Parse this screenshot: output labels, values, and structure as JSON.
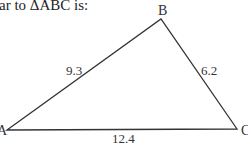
{
  "prompt": {
    "text": "ar to ΔABC is:"
  },
  "triangle": {
    "name": "ΔABC",
    "stroke_color": "#333333",
    "vertices": [
      {
        "id": "A",
        "label": "A",
        "x": 7,
        "y": 130,
        "label_x": -3,
        "label_y": 135
      },
      {
        "id": "B",
        "label": "B",
        "x": 161,
        "y": 19,
        "label_x": 158,
        "label_y": 15
      },
      {
        "id": "C",
        "label": "C",
        "x": 237,
        "y": 129,
        "label_x": 241,
        "label_y": 135
      }
    ],
    "sides": [
      {
        "id": "AB",
        "label": "9.3",
        "x": 66,
        "y": 75
      },
      {
        "id": "BC",
        "label": "6.2",
        "x": 201,
        "y": 75
      },
      {
        "id": "AC",
        "label": "12.4",
        "x": 112,
        "y": 143
      }
    ]
  }
}
